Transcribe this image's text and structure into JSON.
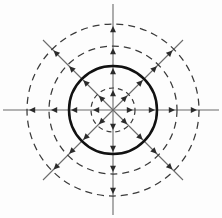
{
  "figure": {
    "background_color": "#fdfdfd",
    "width": 222,
    "height": 218,
    "center": {
      "x": 113,
      "y": 110
    }
  },
  "chart_data": {
    "type": "scatter",
    "title": "",
    "subtitle": "",
    "xlabel": "",
    "ylabel": "",
    "grid": false,
    "legend_position": "none",
    "coordinate_system": "polar",
    "center": {
      "x": 113,
      "y": 110
    },
    "xlim": [
      -113,
      109
    ],
    "ylim": [
      -108,
      110
    ],
    "circles": [
      {
        "name": "inner-dashed-circle",
        "radius": 22,
        "style": "dashed",
        "color": "#3a3a3a",
        "stroke_width": 1.2
      },
      {
        "name": "solid-circle",
        "radius": 44,
        "style": "solid",
        "color": "#111111",
        "stroke_width": 2.5
      },
      {
        "name": "middle-dashed-circle",
        "radius": 64,
        "style": "dashed",
        "color": "#3a3a3a",
        "stroke_width": 1.25
      },
      {
        "name": "outer-dashed-circle",
        "radius": 86,
        "style": "dashed",
        "color": "#3a3a3a",
        "stroke_width": 1.25
      }
    ],
    "axes_lines": [
      {
        "name": "horizontal-axis",
        "angle_deg": 0,
        "length": 113,
        "style": "solid",
        "color": "#6b6b6b"
      },
      {
        "name": "vertical-axis",
        "angle_deg": 90,
        "length": 110,
        "style": "solid",
        "color": "#6b6b6b"
      },
      {
        "name": "diagonal-axis-45",
        "angle_deg": 45,
        "length": 99,
        "style": "solid",
        "color": "#6b6b6b"
      },
      {
        "name": "diagonal-axis-135",
        "angle_deg": 135,
        "length": 99,
        "style": "solid",
        "color": "#6b6b6b"
      }
    ],
    "arrow_angles_deg": [
      0,
      45,
      90,
      135,
      180,
      225,
      270,
      315
    ],
    "arrow_radii": [
      20,
      42,
      62,
      84
    ],
    "arrow_color": "#2b2b2b",
    "series": [
      {
        "name": "radial-markers",
        "description": "Arrowheads pointing radially outward where each of the eight rays meets each of the four circles",
        "values": [
          20,
          42,
          62,
          84
        ]
      }
    ],
    "annotations": []
  }
}
